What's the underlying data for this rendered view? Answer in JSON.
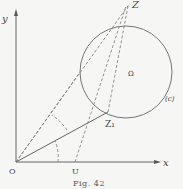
{
  "figure": {
    "caption": "Fig. 42",
    "labels": {
      "y_axis": "y",
      "x_axis": "x",
      "origin": "O",
      "point_u": "U",
      "point_z": "Z",
      "point_z1": "Z₁",
      "center": "Ω",
      "circle": "(c)"
    },
    "colors": {
      "ink": "#555555",
      "background": "#f6f6f4"
    }
  }
}
